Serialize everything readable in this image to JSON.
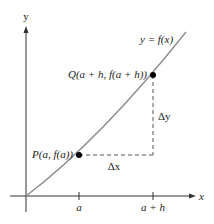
{
  "diagram": {
    "type": "secant-line-difference-quotient",
    "axes": {
      "x_label": "x",
      "y_label": "y",
      "origin": [
        26,
        196
      ]
    },
    "curve": {
      "label": "y = f(x)",
      "color": "#8a8a8a"
    },
    "points": {
      "P": {
        "label": "P(a, f(a))",
        "x": 79,
        "y": 155
      },
      "Q": {
        "label": "Q(a + h, f(a + h))",
        "x": 153,
        "y": 75
      }
    },
    "increments": {
      "dx_label": "Δx",
      "dy_label": "Δy"
    },
    "ticks": {
      "a": "a",
      "a_plus_h": "a + h"
    },
    "colors": {
      "axis": "#333333",
      "curve": "#8a8a8a",
      "dashed": "#555555",
      "point": "#000000",
      "text": "#222222",
      "background": "#ffffff"
    }
  }
}
